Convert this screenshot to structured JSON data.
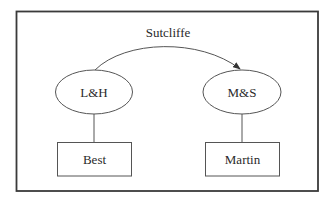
{
  "diagram": {
    "title_edge": {
      "label": "Sutcliffe",
      "from": "L&H",
      "to": "M&S",
      "type": "curved-arrow"
    },
    "nodes": [
      {
        "id": "lh",
        "label": "L&H",
        "shape": "ellipse"
      },
      {
        "id": "ms",
        "label": "M&S",
        "shape": "ellipse"
      },
      {
        "id": "best",
        "label": "Best",
        "shape": "rectangle"
      },
      {
        "id": "martin",
        "label": "Martin",
        "shape": "rectangle"
      }
    ],
    "edges": [
      {
        "from": "L&H",
        "to": "M&S",
        "label": "Sutcliffe",
        "directed": true
      },
      {
        "from": "L&H",
        "to": "Best",
        "directed": false
      },
      {
        "from": "M&S",
        "to": "Martin",
        "directed": false
      }
    ]
  },
  "colors": {
    "frame": "#3a3a3a",
    "stroke": "#555555",
    "text": "#2a2a2a",
    "background": "#ffffff"
  }
}
